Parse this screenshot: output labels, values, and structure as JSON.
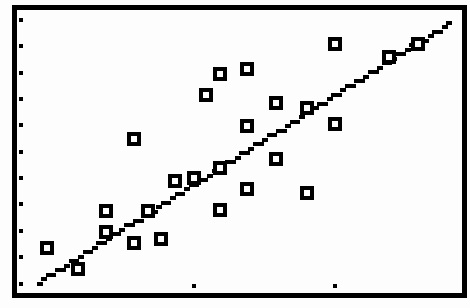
{
  "screen": {
    "background": "#fdfdfd",
    "frame_color": "#000000",
    "marker_color": "#000000"
  },
  "chart_data": {
    "type": "scatter",
    "title": "",
    "xlabel": "",
    "ylabel": "",
    "grid": false,
    "legend": null,
    "xlim": [
      -0.25,
      2.9
    ],
    "ylim": [
      -0.36,
      10.37
    ],
    "x_ticks": [
      1,
      2
    ],
    "y_ticks": [
      0,
      1,
      2,
      3,
      4,
      5,
      6,
      7,
      8,
      9,
      10
    ],
    "marker": "hollow-square",
    "series": [
      {
        "name": "data",
        "points": [
          {
            "x": -0.04,
            "y": 1.36
          },
          {
            "x": 0.18,
            "y": 0.55
          },
          {
            "x": 0.38,
            "y": 2.76
          },
          {
            "x": 0.38,
            "y": 1.95
          },
          {
            "x": 0.58,
            "y": 1.54
          },
          {
            "x": 0.58,
            "y": 5.48
          },
          {
            "x": 0.68,
            "y": 2.76
          },
          {
            "x": 0.77,
            "y": 1.69
          },
          {
            "x": 0.87,
            "y": 3.9
          },
          {
            "x": 1.0,
            "y": 4.01
          },
          {
            "x": 1.09,
            "y": 7.13
          },
          {
            "x": 1.19,
            "y": 7.94
          },
          {
            "x": 1.19,
            "y": 4.38
          },
          {
            "x": 1.19,
            "y": 2.79
          },
          {
            "x": 1.38,
            "y": 8.13
          },
          {
            "x": 1.38,
            "y": 5.99
          },
          {
            "x": 1.38,
            "y": 3.6
          },
          {
            "x": 1.58,
            "y": 6.84
          },
          {
            "x": 1.58,
            "y": 4.71
          },
          {
            "x": 1.8,
            "y": 6.65
          },
          {
            "x": 1.8,
            "y": 3.42
          },
          {
            "x": 2.0,
            "y": 9.08
          },
          {
            "x": 2.0,
            "y": 6.03
          },
          {
            "x": 2.38,
            "y": 8.6
          },
          {
            "x": 2.59,
            "y": 9.08
          }
        ]
      }
    ],
    "regression_line": {
      "type": "linear",
      "start": {
        "x": -0.09,
        "y": 0.04
      },
      "end": {
        "x": 2.81,
        "y": 9.85
      }
    }
  }
}
